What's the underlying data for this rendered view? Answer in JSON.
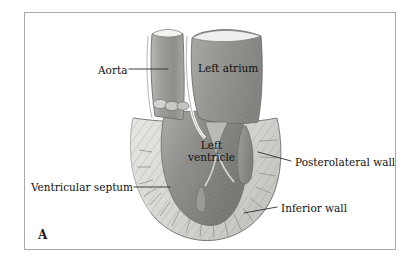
{
  "figure": {
    "panel_letter": "A",
    "frame_color": "#a8a8a8",
    "background_color": "#ffffff"
  },
  "labels": {
    "aorta": "Aorta",
    "left_atrium": "Left atrium",
    "left_ventricle_line1": "Left",
    "left_ventricle_line2": "ventricle",
    "posterolateral_wall": "Posterolateral wall",
    "inferior_wall": "Inferior wall",
    "ventricular_septum": "Ventricular septum"
  },
  "colors": {
    "myocardium_light": "#dcdcd8",
    "myocardium_mid": "#c3c3bf",
    "cavity_dark": "#8e8e8e",
    "cavity_mid": "#a0a09e",
    "outline": "#6e6e6e",
    "hatch": "#9a9a96",
    "highlight": "#f4f4f2",
    "leader_line": "#2b2b2b"
  }
}
